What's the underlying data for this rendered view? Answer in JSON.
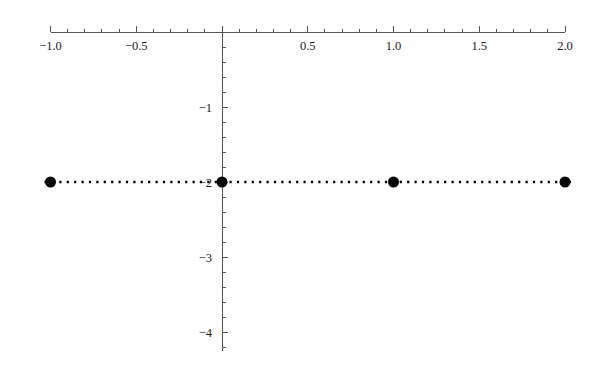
{
  "chart_data": {
    "type": "scatter",
    "title": "",
    "subtitle": "",
    "xlabel": "",
    "ylabel": "",
    "xlim": [
      -1.0,
      2.0
    ],
    "ylim": [
      -4.25,
      0.1
    ],
    "grid": false,
    "legend": null,
    "legend_position": "none",
    "background_color": "#ffffff",
    "axis_color": "#555555",
    "marker_color": "#000000",
    "line_color": "#000000",
    "line_style": "dotted",
    "marker_style": "filled-circle",
    "marker_size_px": 11,
    "x": [
      -1.0,
      0.0,
      1.0,
      2.0
    ],
    "y": [
      -2.0,
      -2.0,
      -2.0,
      -2.0
    ],
    "series": [
      {
        "name": "y = -2",
        "x": [
          -1.0,
          0.0,
          1.0,
          2.0
        ],
        "values": [
          -2.0,
          -2.0,
          -2.0,
          -2.0
        ]
      }
    ],
    "xticks": [
      -1.0,
      -0.5,
      0.0,
      0.5,
      1.0,
      1.5,
      2.0
    ],
    "xtick_labels": [
      "-1.0",
      "-0.5",
      "",
      "0.5",
      "1.0",
      "1.5",
      "2.0"
    ],
    "x_minor_tick_step": 0.1,
    "yticks": [
      -1,
      -2,
      -3,
      -4
    ],
    "ytick_labels": [
      "-1",
      "-2",
      "-3",
      "-4"
    ],
    "y_minor_tick_step": 0.2,
    "axes_style": "crossed-at-origin",
    "x_axis_position": "y=0",
    "y_axis_position": "x=0",
    "annotations": []
  },
  "axis_labels": {
    "x": [
      {
        "value": -1.0,
        "text": "−1.0"
      },
      {
        "value": -0.5,
        "text": "−0.5"
      },
      {
        "value": 0.5,
        "text": "0.5"
      },
      {
        "value": 1.0,
        "text": "1.0"
      },
      {
        "value": 1.5,
        "text": "1.5"
      },
      {
        "value": 2.0,
        "text": "2.0"
      }
    ],
    "y": [
      {
        "value": -1,
        "text": "−1"
      },
      {
        "value": -2,
        "text": "−2"
      },
      {
        "value": -3,
        "text": "−3"
      },
      {
        "value": -4,
        "text": "−4"
      }
    ]
  }
}
